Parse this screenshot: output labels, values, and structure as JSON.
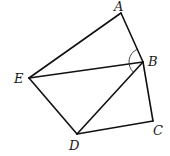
{
  "diagram": {
    "type": "geometry-figure",
    "points": {
      "A": {
        "x": 121,
        "y": 13,
        "label": "A",
        "lx": 114,
        "ly": 11
      },
      "B": {
        "x": 143,
        "y": 62,
        "label": "B",
        "lx": 148,
        "ly": 66
      },
      "C": {
        "x": 153,
        "y": 121,
        "label": "C",
        "lx": 153,
        "ly": 135
      },
      "D": {
        "x": 77,
        "y": 134,
        "label": "D",
        "lx": 69,
        "ly": 150
      },
      "E": {
        "x": 29,
        "y": 78,
        "label": "E",
        "lx": 14,
        "ly": 83
      }
    },
    "segments": [
      [
        "E",
        "A"
      ],
      [
        "A",
        "B"
      ],
      [
        "B",
        "C"
      ],
      [
        "C",
        "D"
      ],
      [
        "D",
        "E"
      ],
      [
        "E",
        "B"
      ],
      [
        "B",
        "D"
      ]
    ],
    "angle_marks": [
      {
        "vertex": "B",
        "from": "A",
        "to": "D",
        "style": "arc"
      }
    ],
    "stroke_color": "#111111"
  }
}
